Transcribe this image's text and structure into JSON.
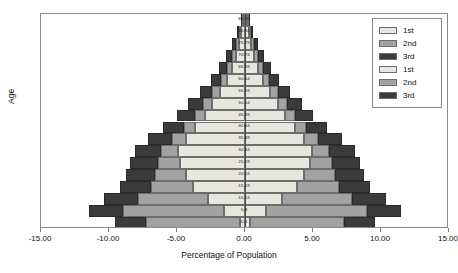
{
  "chart_data": {
    "type": "bar",
    "subtype": "population-pyramid-stacked-horizontal",
    "title": "",
    "xlabel": "Percentage of Population",
    "ylabel": "Age",
    "xlim": [
      -15.0,
      15.0
    ],
    "xticks": [
      -15.0,
      -10.0,
      -5.0,
      0.0,
      5.0,
      10.0,
      15.0
    ],
    "xtick_labels": [
      "-15.00",
      "-10.00",
      "-5.00",
      "0.00",
      "5.00",
      "10.00",
      "15.00"
    ],
    "grid": false,
    "legend_position": "top-right",
    "categories": [
      "0-4",
      "5-9",
      "10-14",
      "15-19",
      "20-24",
      "25-29",
      "30-34",
      "35-39",
      "40-44",
      "45-49",
      "50-54",
      "55-59",
      "60-64",
      "65-69",
      "70-74",
      "75-79",
      "80-84",
      "85-90"
    ],
    "series": [
      {
        "name": "1st",
        "side": "left",
        "color": "#e7e7df",
        "values": [
          0.35,
          1.55,
          2.75,
          3.85,
          4.35,
          4.75,
          4.95,
          4.35,
          3.65,
          2.95,
          2.45,
          1.85,
          1.35,
          0.95,
          0.65,
          0.45,
          0.28,
          0.12
        ]
      },
      {
        "name": "2nd",
        "side": "left",
        "color": "#a2a2a2",
        "values": [
          6.95,
          7.45,
          5.15,
          3.05,
          2.25,
          1.65,
          1.25,
          1.05,
          0.85,
          0.75,
          0.65,
          0.55,
          0.45,
          0.38,
          0.3,
          0.22,
          0.14,
          0.07
        ]
      },
      {
        "name": "3rd",
        "side": "left",
        "color": "#3b3b3b",
        "values": [
          2.25,
          2.5,
          2.45,
          2.3,
          2.15,
          2.05,
          1.9,
          1.7,
          1.5,
          1.3,
          1.1,
          0.9,
          0.72,
          0.57,
          0.42,
          0.3,
          0.18,
          0.09
        ]
      },
      {
        "name": "1st",
        "side": "right",
        "color": "#e7e7df",
        "values": [
          0.35,
          1.55,
          2.75,
          3.85,
          4.35,
          4.75,
          4.95,
          4.35,
          3.65,
          2.95,
          2.45,
          1.85,
          1.35,
          0.95,
          0.65,
          0.45,
          0.28,
          0.12
        ]
      },
      {
        "name": "2nd",
        "side": "right",
        "color": "#a2a2a2",
        "values": [
          6.95,
          7.45,
          5.15,
          3.05,
          2.25,
          1.65,
          1.25,
          1.05,
          0.85,
          0.75,
          0.65,
          0.55,
          0.45,
          0.38,
          0.3,
          0.22,
          0.14,
          0.07
        ]
      },
      {
        "name": "3rd",
        "side": "right",
        "color": "#3b3b3b",
        "values": [
          2.25,
          2.5,
          2.45,
          2.3,
          2.15,
          2.05,
          1.9,
          1.7,
          1.5,
          1.3,
          1.1,
          0.9,
          0.72,
          0.57,
          0.42,
          0.3,
          0.18,
          0.09
        ]
      }
    ]
  },
  "legend": {
    "entries": [
      {
        "label": "1st",
        "color": "#e7e7df"
      },
      {
        "label": "2nd",
        "color": "#a2a2a2"
      },
      {
        "label": "3rd",
        "color": "#3b3b3b"
      },
      {
        "label": "1st",
        "color": "#e7e7df"
      },
      {
        "label": "2nd",
        "color": "#a2a2a2"
      },
      {
        "label": "3rd",
        "color": "#3b3b3b"
      }
    ]
  },
  "colors": {
    "first": "#e7e7df",
    "second": "#a2a2a2",
    "third": "#3b3b3b",
    "frame": "#8a8a8a",
    "axis": "#4a4a4a",
    "background": "#ffffff"
  }
}
